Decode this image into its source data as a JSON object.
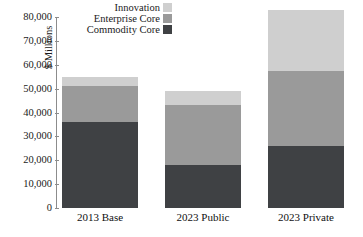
{
  "chart_data": {
    "type": "bar",
    "stacked": true,
    "title": "",
    "subtitle": "",
    "xlabel": "",
    "ylabel": "$ Millions",
    "ylim": [
      0,
      80000
    ],
    "ytick_step": 10000,
    "ytick_labels": [
      "80,000",
      "70,000",
      "60,000",
      "50,000",
      "40,000",
      "30,000",
      "20,000",
      "10,000",
      "0"
    ],
    "ytick_values": [
      80000,
      70000,
      60000,
      50000,
      40000,
      30000,
      20000,
      10000,
      0
    ],
    "grid": false,
    "legend_position": "top-left-inside",
    "categories": [
      "2013 Base",
      "2023 Public",
      "2023 Private"
    ],
    "series": [
      {
        "name": "Commodity Core",
        "color": "#3f4144",
        "values": [
          36000,
          18000,
          26000
        ]
      },
      {
        "name": "Enterprise Core",
        "color": "#9a9a9a",
        "values": [
          15000,
          25000,
          31500
        ]
      },
      {
        "name": "Innovation",
        "color": "#cfcfcf",
        "values": [
          4000,
          6000,
          25500
        ]
      }
    ],
    "totals": [
      55000,
      49000,
      83000
    ]
  },
  "legend": {
    "items": [
      {
        "label": "Innovation",
        "color": "#cfcfcf"
      },
      {
        "label": "Enterprise Core",
        "color": "#9a9a9a"
      },
      {
        "label": "Commodity Core",
        "color": "#3f4144"
      }
    ]
  },
  "axis": {
    "y_title": "$ Millions",
    "axis_color": "#8c8c8c"
  }
}
